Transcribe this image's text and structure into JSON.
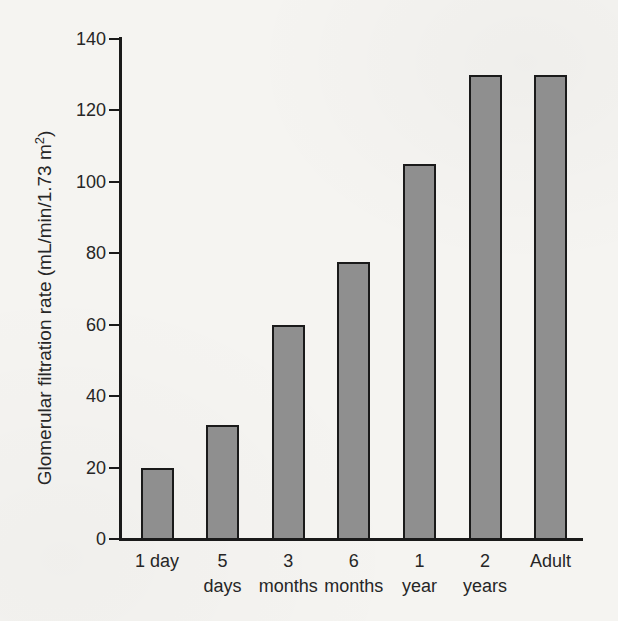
{
  "figure": {
    "background_color": "#f5f4f1"
  },
  "chart_data": {
    "type": "bar",
    "title": "",
    "categories": [
      "1 day",
      "5 days",
      "3 months",
      "6 months",
      "1 year",
      "2 years",
      "Adult"
    ],
    "category_tick_lines": [
      [
        "1 day"
      ],
      [
        "5",
        "days"
      ],
      [
        "3",
        "months"
      ],
      [
        "6",
        "months"
      ],
      [
        "1",
        "year"
      ],
      [
        "2",
        "years"
      ],
      [
        "Adult"
      ]
    ],
    "values": [
      20,
      32,
      60,
      77.5,
      105,
      130,
      130
    ],
    "xlabel": "",
    "ylabel": "Glomerular filtration rate (mL/min/1.73 m²)",
    "ylabel_parts": {
      "prefix": "Glomerular filtration rate (mL/min/1.73 m",
      "superscript": "2",
      "suffix": ")"
    },
    "ylim": [
      0,
      140
    ],
    "yticks": [
      0,
      20,
      40,
      60,
      80,
      100,
      120,
      140
    ],
    "grid": false,
    "legend": "none",
    "bar_fill_color": "#8f8f8f",
    "bar_border_color": "#1a1a1a",
    "axis_color": "#1a1a1a",
    "text_color": "#262626"
  }
}
